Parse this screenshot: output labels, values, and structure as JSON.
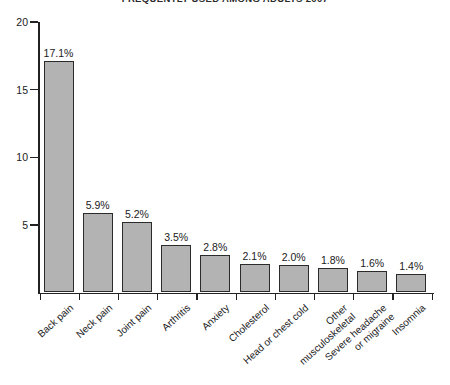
{
  "chart_data": {
    "type": "bar",
    "title": "FREQUENTLY USED AMONG ADULTS 2007",
    "xlabel": "",
    "ylabel": "",
    "ylim": [
      0,
      20
    ],
    "yticks": [
      20,
      15,
      10,
      5
    ],
    "ytick_labels": [
      "20",
      "15",
      "10",
      "5"
    ],
    "grid": false,
    "legend": null,
    "bar_color": "#b3b3b3",
    "bar_border_color": "#2b2b2b",
    "axis_color": "#222222",
    "background": "#ffffff",
    "categories": [
      "Back pain",
      "Neck pain",
      "Joint pain",
      "Arthritis",
      "Anxiety",
      "Cholesterol",
      "Head or chest cold",
      "Other musculoskeletal",
      "Severe headache or migraine",
      "Insomnia"
    ],
    "category_lines": [
      [
        "Back pain"
      ],
      [
        "Neck pain"
      ],
      [
        "Joint pain"
      ],
      [
        "Arthritis"
      ],
      [
        "Anxiety"
      ],
      [
        "Cholesterol"
      ],
      [
        "Head or chest cold"
      ],
      [
        "Other",
        "musculoskeletal"
      ],
      [
        "Severe headache",
        "or migraine"
      ],
      [
        "Insomnia"
      ]
    ],
    "values": [
      17.1,
      5.9,
      5.2,
      3.5,
      2.8,
      2.1,
      2.0,
      1.8,
      1.6,
      1.4
    ],
    "data_labels": [
      "17.1%",
      "5.9%",
      "5.2%",
      "3.5%",
      "2.8%",
      "2.1%",
      "2.0%",
      "1.8%",
      "1.6%",
      "1.4%"
    ]
  }
}
